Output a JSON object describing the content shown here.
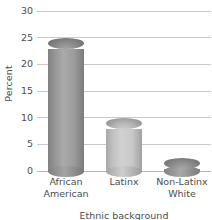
{
  "chart_data": {
    "type": "bar",
    "title": "",
    "subtitle": "",
    "xlabel": "Ethnic background",
    "ylabel": "Percent",
    "categories": [
      "African American",
      "Latinx",
      "Non-Latinx White"
    ],
    "category_lines": [
      [
        "African",
        "American"
      ],
      [
        "Latinx"
      ],
      [
        "Non-Latinx",
        "White"
      ]
    ],
    "values": [
      24,
      9,
      1.5
    ],
    "ylim": [
      0,
      30
    ],
    "yticks": [
      0,
      5,
      10,
      15,
      20,
      25,
      30
    ],
    "ytick_labels": [
      "0",
      "5",
      "10",
      "15",
      "20",
      "25",
      "30"
    ],
    "grid": true,
    "legend": "none",
    "style": "3d-cylinder",
    "bar_colors": [
      "#9a9a9a",
      "#c8c8c8",
      "#9e9e9e"
    ]
  },
  "axes": {
    "y_title": "Percent",
    "x_title": "Ethnic background"
  }
}
